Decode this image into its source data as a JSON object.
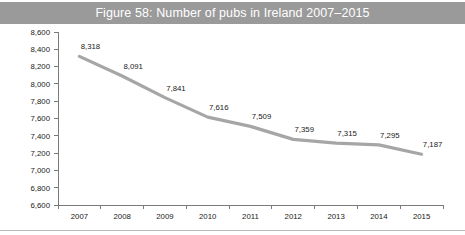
{
  "figure": {
    "title": "Figure 58: Number of pubs in Ireland 2007–2015",
    "title_band_color": "#9a9a9a",
    "title_text_color": "#ffffff",
    "background_color": "#ffffff"
  },
  "chart_data": {
    "type": "line",
    "title": "Figure 58: Number of pubs in Ireland 2007–2015",
    "xlabel": "",
    "ylabel": "",
    "categories": [
      "2007",
      "2008",
      "2009",
      "2010",
      "2011",
      "2012",
      "2013",
      "2014",
      "2015"
    ],
    "values": [
      8318,
      8091,
      7841,
      7616,
      7509,
      7359,
      7315,
      7295,
      7187
    ],
    "point_labels": [
      "8,318",
      "8,091",
      "7,841",
      "7,616",
      "7,509",
      "7,359",
      "7,315",
      "7,295",
      "7,187"
    ],
    "ylim": [
      6600,
      8600
    ],
    "ytick_step": 200,
    "ytick_labels": [
      "8,600",
      "8,400",
      "8,200",
      "8,000",
      "7,800",
      "7,600",
      "7,400",
      "7,200",
      "7,000",
      "6,800",
      "6,600"
    ],
    "ytick_values": [
      8600,
      8400,
      8200,
      8000,
      7800,
      7600,
      7400,
      7200,
      7000,
      6800,
      6600
    ],
    "grid": false,
    "legend": null,
    "series_color": "#a6a6a6",
    "series_line_width": 3.2,
    "axis_color": "#7a7a7a",
    "text_color": "#1a1a1a"
  }
}
